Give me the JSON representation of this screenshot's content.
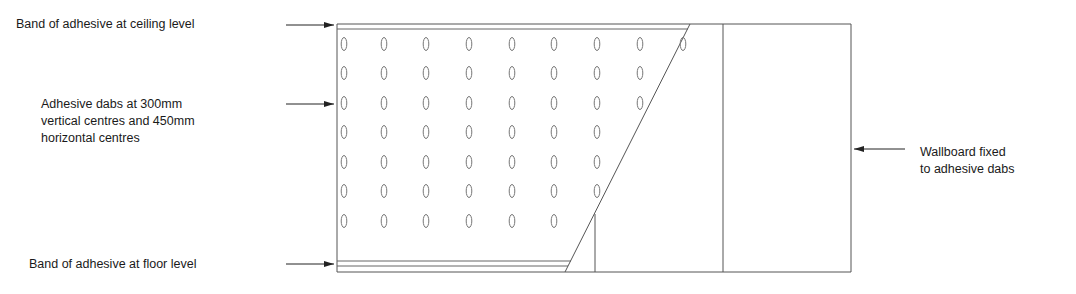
{
  "diagram": {
    "type": "construction-detail",
    "colors": {
      "line": "#555555",
      "text": "#1a1a1a",
      "dab": "#777777",
      "background": "#ffffff"
    },
    "labels": {
      "ceiling_band": "Band of adhesive at ceiling level",
      "dabs": {
        "line1": "Adhesive dabs at 300mm",
        "line2": "vertical centres and 450mm",
        "line3": "horizontal centres"
      },
      "floor_band": "Band of adhesive at floor level",
      "wallboard": {
        "line1": "Wallboard fixed",
        "line2": "to adhesive dabs"
      }
    },
    "dab_grid": {
      "columns_x": [
        341,
        381,
        423,
        466,
        509,
        551,
        594,
        637,
        680
      ],
      "rows_y": [
        44,
        73,
        103,
        132,
        162,
        191,
        221
      ],
      "visible_per_row": [
        9,
        8,
        8,
        7,
        7,
        7,
        6
      ],
      "vertical_centres": "300mm",
      "horizontal_centres": "450mm"
    },
    "wall_outline": {
      "left": 337,
      "top": 24,
      "right": 851,
      "bottom": 272
    },
    "board_divider_x": 723
  }
}
